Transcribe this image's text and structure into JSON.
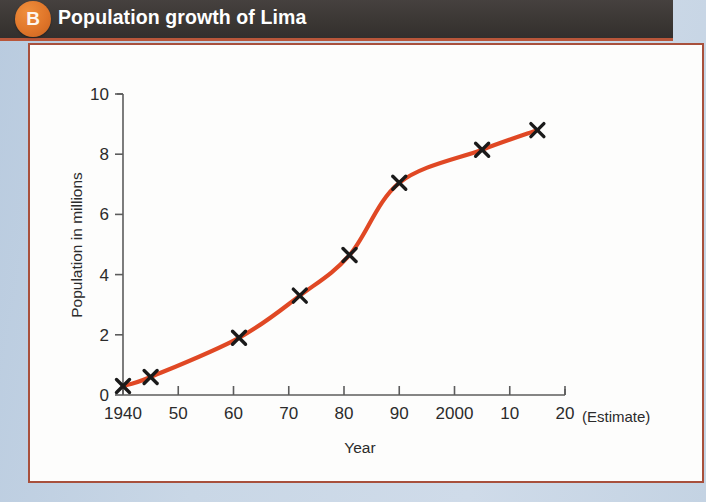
{
  "header": {
    "badge_label": "B",
    "title": "Population growth of Lima",
    "badge_color": "#e0762a",
    "band_color": "#3b3734",
    "underline_color": "#b8563a"
  },
  "panel": {
    "border_color": "#a8503c",
    "background_color": "#fdfdfc"
  },
  "chart_data": {
    "type": "line",
    "title": "Population growth of Lima",
    "xlabel": "Year",
    "ylabel": "Population in millions",
    "x_tick_labels": [
      "1940",
      "50",
      "60",
      "70",
      "80",
      "90",
      "2000",
      "10",
      "20"
    ],
    "x_tick_values": [
      1940,
      1950,
      1960,
      1970,
      1980,
      1990,
      2000,
      2010,
      2020
    ],
    "y_tick_labels": [
      "0",
      "2",
      "4",
      "6",
      "8",
      "10"
    ],
    "y_tick_values": [
      0,
      2,
      4,
      6,
      8,
      10
    ],
    "xlim": [
      1940,
      2020
    ],
    "ylim": [
      0,
      10
    ],
    "grid": false,
    "legend": "none",
    "annotation": "(Estimate)",
    "line_color": "#e04824",
    "marker_color": "#1a1a1a",
    "marker_style": "x",
    "series": [
      {
        "name": "Population of Lima",
        "x": [
          1940,
          1945,
          1961,
          1972,
          1981,
          1990,
          2005,
          2015
        ],
        "values": [
          0.3,
          0.6,
          1.9,
          3.3,
          4.65,
          7.05,
          8.15,
          8.8
        ]
      }
    ]
  },
  "bleed": {
    "line1": "the page behind shows faintly through the paper",
    "line2": "a second line of reversed text is partly visible"
  }
}
